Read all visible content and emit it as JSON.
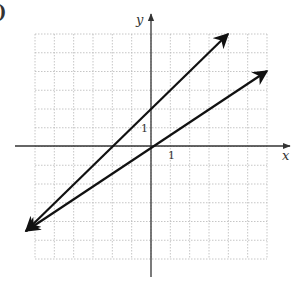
{
  "figure": {
    "corner_label": ")",
    "x_axis_label": "x",
    "y_axis_label": "y",
    "x_tick_label": "1",
    "y_tick_label": "1",
    "grid": {
      "x_min": -6,
      "x_max": 6,
      "y_min": -6,
      "y_max": 6,
      "step": 1
    },
    "colors": {
      "line": "#111111",
      "axis": "#333333",
      "grid": "#b8b8b8"
    }
  },
  "chart_data": {
    "type": "line",
    "title": "",
    "xlabel": "x",
    "ylabel": "y",
    "xlim": [
      -6,
      6
    ],
    "ylim": [
      -6,
      6
    ],
    "grid": true,
    "series": [
      {
        "name": "line through origin",
        "slope": 0.6667,
        "intercept": 0,
        "x": [
          -6.5,
          6
        ],
        "y": [
          -4.33,
          4
        ]
      },
      {
        "name": "line with intercept 2",
        "slope": 1,
        "intercept": 2,
        "x": [
          -6.5,
          4
        ],
        "y": [
          -4.5,
          6
        ]
      }
    ],
    "intersection": {
      "x": -6,
      "y": -4
    }
  }
}
